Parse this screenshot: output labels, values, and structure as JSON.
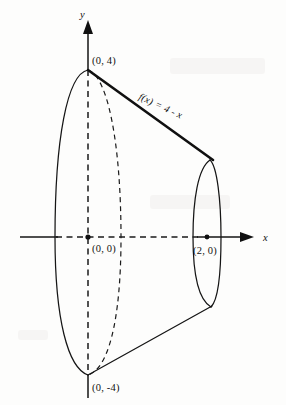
{
  "figure": {
    "kind": "solid-of-revolution",
    "background_color": "#fdfdfc",
    "ink_color": "#111111"
  },
  "axes": {
    "x_label": "x",
    "y_label": "y",
    "x_axis": {
      "solid_left_start": 20,
      "solid_left_end": 56,
      "dashed_start": 56,
      "dashed_end": 197,
      "solid_right_start": 197,
      "solid_right_end": 246,
      "y": 237
    },
    "y_axis": {
      "x": 88,
      "solid_top_start": 22,
      "solid_top_end": 70,
      "dashed_start": 70,
      "dashed_end": 375,
      "solid_bottom_start": 375,
      "solid_bottom_end": 398
    }
  },
  "points": [
    {
      "id": "apex-top",
      "label": "(0, 4)",
      "x": 88,
      "y": 70,
      "label_x": 92,
      "label_y": 62,
      "has_dot": false
    },
    {
      "id": "origin",
      "label": "(0, 0)",
      "x": 88,
      "y": 237,
      "label_x": 92,
      "label_y": 251,
      "has_dot": true
    },
    {
      "id": "x-two",
      "label": "(2, 0)",
      "x": 207,
      "y": 237,
      "label_x": 196,
      "label_y": 253,
      "has_dot": true
    },
    {
      "id": "apex-bottom",
      "label": "(0, -4)",
      "x": 88,
      "y": 375,
      "label_x": 92,
      "label_y": 388,
      "has_dot": false
    }
  ],
  "function_label": {
    "text": "f(x) = 4 - x",
    "x": 150,
    "y": 103,
    "rotation_deg": 25
  },
  "geometry": {
    "left_ellipse": {
      "center_x": 88,
      "center_y": 237,
      "radius_x": 33,
      "radius_y": 141,
      "near_half_style": "dashed",
      "far_half_style": "solid"
    },
    "right_ellipse": {
      "center_x": 207,
      "center_y": 237,
      "radius_x": 14,
      "radius_y": 76,
      "style": "solid"
    },
    "upper_generator": {
      "from_x": 88,
      "from_y": 70,
      "to_x": 212,
      "to_y": 161,
      "style": "thick-solid"
    },
    "lower_generator": {
      "from_x": 88,
      "from_y": 375,
      "to_x": 212,
      "to_y": 306,
      "style": "solid"
    }
  }
}
